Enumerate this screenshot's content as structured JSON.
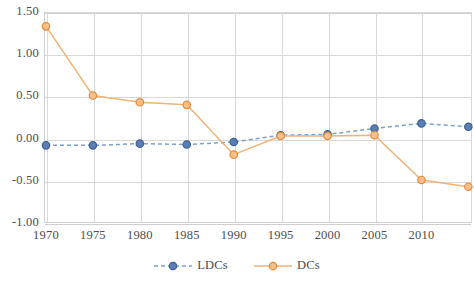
{
  "chart_data": {
    "type": "line",
    "title": "",
    "subtitle": "",
    "xlabel": "",
    "ylabel": "",
    "x": [
      1970,
      1975,
      1980,
      1985,
      1990,
      1995,
      2000,
      2005,
      2010,
      2015
    ],
    "categories": [
      "1970",
      "1975",
      "1980",
      "1985",
      "1990",
      "1995",
      "2000",
      "2005",
      "2010",
      "2015"
    ],
    "xtick_labels": [
      "1970",
      "1975",
      "1980",
      "1985",
      "1990",
      "1995",
      "2000",
      "2005",
      "2010"
    ],
    "ytick_labels": [
      "1.50",
      "1.00",
      "0.50",
      "0.00",
      "-0.50",
      "-1.00"
    ],
    "ytick_values": [
      1.5,
      1.0,
      0.5,
      0.0,
      -0.5,
      -1.0
    ],
    "ylim": [
      -1.0,
      1.5
    ],
    "xlim": [
      1970,
      2015
    ],
    "grid": true,
    "legend_position": "bottom",
    "series": [
      {
        "name": "LDCs",
        "color": "#4472a8",
        "marker": "circle",
        "linestyle": "dashed",
        "values": [
          -0.08,
          -0.08,
          -0.06,
          -0.07,
          -0.04,
          0.04,
          0.05,
          0.12,
          0.18,
          0.14
        ]
      },
      {
        "name": "DCs",
        "color": "#ed9a4b",
        "marker": "circle",
        "linestyle": "solid",
        "values": [
          1.33,
          0.51,
          0.43,
          0.4,
          -0.19,
          0.03,
          0.03,
          0.04,
          -0.49,
          -0.57
        ]
      }
    ]
  },
  "legend": {
    "entries": [
      {
        "label": "LDCs",
        "color": "#4472a8",
        "style": "dashed"
      },
      {
        "label": "DCs",
        "color": "#ed9a4b",
        "style": "solid"
      }
    ]
  },
  "colors": {
    "ldcs_line": "#7f9fc8",
    "ldcs_marker_fill": "#5b7fb4",
    "ldcs_marker_edge": "#3d5f95",
    "dcs_line": "#f0b277",
    "dcs_marker_fill": "#fbc089",
    "dcs_marker_edge": "#e08a3c",
    "gridline": "#d9d9d9",
    "axis": "#cfcfcf",
    "text": "#4d4d4d",
    "background": "#ffffff"
  }
}
